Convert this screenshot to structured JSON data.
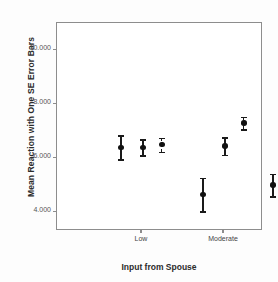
{
  "chart_data": {
    "type": "scatter",
    "title": "",
    "subtitle": "",
    "xlabel": "Input from Spouse",
    "ylabel": "Mean Reaction with One SE Error Bars",
    "categories": [
      "Low",
      "Moderate",
      "High"
    ],
    "yticks": [
      "4.000",
      "6.000",
      "8.000",
      "10.000"
    ],
    "ytick_values": [
      4000,
      6000,
      8000,
      10000
    ],
    "ylim": [
      3300,
      11000
    ],
    "grid": false,
    "legend": null,
    "error_bar_type": "one standard error",
    "series": [
      {
        "name": "series-1",
        "values": [
          6400,
          4650,
          5000
        ],
        "errors": [
          450,
          620,
          420
        ],
        "line_style": "solid"
      },
      {
        "name": "series-2",
        "values": [
          6400,
          6450,
          6100
        ],
        "errors": [
          300,
          330,
          300
        ],
        "line_style": "solid"
      },
      {
        "name": "series-3",
        "values": [
          6500,
          7300,
          9750
        ],
        "errors": [
          260,
          230,
          230
        ],
        "line_style": "dashed"
      }
    ]
  },
  "axes": {
    "y_title": "Mean Reaction with One SE Error Bars",
    "x_title": "Input from Spouse"
  }
}
